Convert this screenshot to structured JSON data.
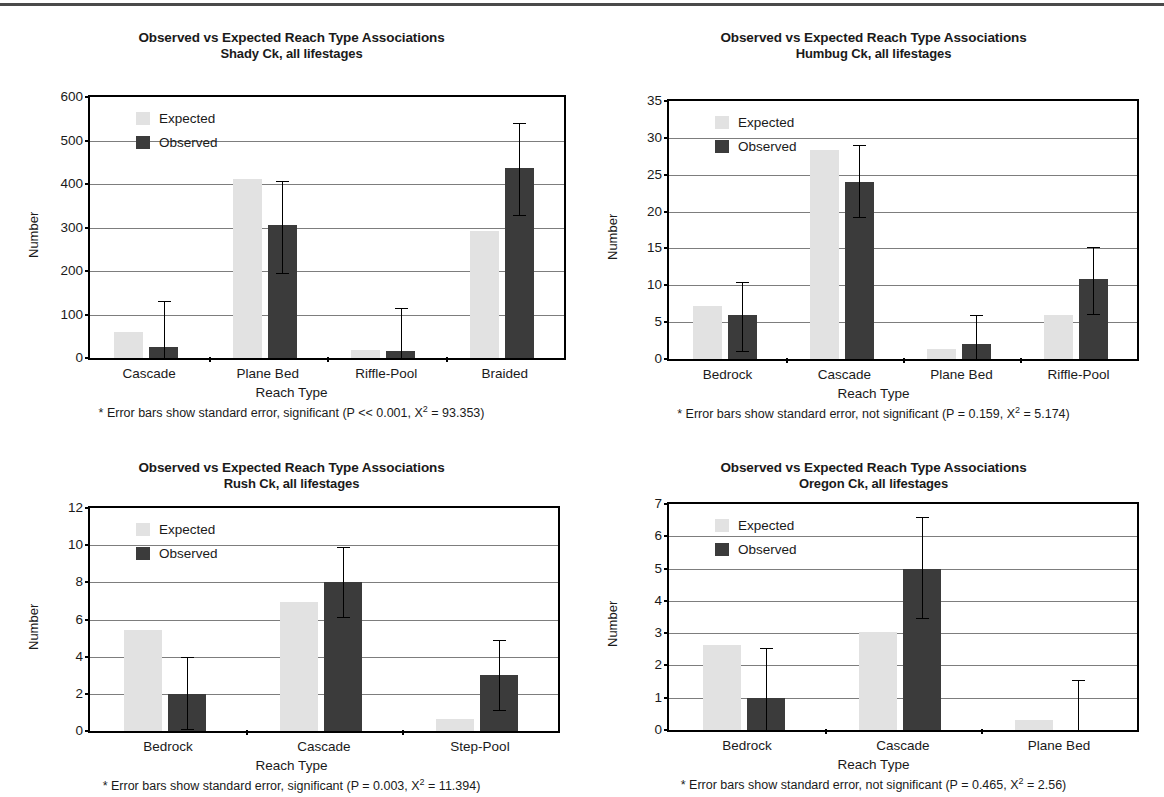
{
  "page": {
    "rule": true
  },
  "legend": {
    "expected_label": "Expected",
    "observed_label": "Observed",
    "expected_color": "#e2e2e2",
    "observed_color": "#3b3b3b"
  },
  "common": {
    "title_line1": "Observed vs Expected Reach Type Associations",
    "ylabel": "Number",
    "xlabel": "Reach Type"
  },
  "chart_data": [
    {
      "id": "shady-ck",
      "type": "bar",
      "title": "Observed vs Expected Reach Type Associations",
      "subtitle": "Shady Ck, all lifestages",
      "xlabel": "Reach Type",
      "ylabel": "Number",
      "ylim": [
        0,
        600
      ],
      "yticks": [
        0,
        100,
        200,
        300,
        400,
        500,
        600
      ],
      "grid": true,
      "legend_position": "top-left-inside",
      "categories": [
        "Cascade",
        "Plane Bed",
        "Riffle-Pool",
        "Braided"
      ],
      "series": [
        {
          "name": "Expected",
          "values": [
            60,
            411,
            18,
            293
          ]
        },
        {
          "name": "Observed",
          "values": [
            25,
            305,
            17,
            436
          ],
          "err_low": [
            25,
            110,
            17,
            108
          ],
          "err_high": [
            107,
            103,
            97,
            105
          ]
        }
      ],
      "footnote": "* Error bars show standard error, significant (P << 0.001, X2 = 93.353)",
      "footnote_parts": {
        "prefix": "* Error bars show standard error, significant (P << 0.001, X",
        "sup": "2",
        "suffix": " = 93.353)"
      }
    },
    {
      "id": "humbug-ck",
      "type": "bar",
      "title": "Observed vs Expected Reach Type Associations",
      "subtitle": "Humbug Ck, all lifestages",
      "xlabel": "Reach Type",
      "ylabel": "Number",
      "ylim": [
        0,
        35
      ],
      "yticks": [
        0,
        5,
        10,
        15,
        20,
        25,
        30,
        35
      ],
      "grid": true,
      "legend_position": "top-left-inside",
      "categories": [
        "Bedrock",
        "Cascade",
        "Plane Bed",
        "Riffle-Pool"
      ],
      "series": [
        {
          "name": "Expected",
          "values": [
            7.2,
            28.4,
            1.3,
            6.0
          ]
        },
        {
          "name": "Observed",
          "values": [
            6.0,
            24.0,
            2.0,
            10.9
          ],
          "err_low": [
            4.9,
            4.8,
            2.0,
            4.8
          ],
          "err_high": [
            4.4,
            5.0,
            4.0,
            4.3
          ]
        }
      ],
      "footnote": "* Error bars show standard error, not significant (P = 0.159, X2 = 5.174)",
      "footnote_parts": {
        "prefix": "* Error bars show standard error, not significant (P = 0.159, X",
        "sup": "2",
        "suffix": " = 5.174)"
      }
    },
    {
      "id": "rush-ck",
      "type": "bar",
      "title": "Observed vs Expected Reach Type Associations",
      "subtitle": "Rush Ck, all lifestages",
      "xlabel": "Reach Type",
      "ylabel": "Number",
      "ylim": [
        0,
        12
      ],
      "yticks": [
        0,
        2,
        4,
        6,
        8,
        10,
        12
      ],
      "grid": true,
      "legend_position": "top-left-inside",
      "categories": [
        "Bedrock",
        "Cascade",
        "Step-Pool"
      ],
      "series": [
        {
          "name": "Expected",
          "values": [
            5.45,
            6.95,
            0.65
          ]
        },
        {
          "name": "Observed",
          "values": [
            2.0,
            8.0,
            3.0
          ],
          "err_low": [
            1.9,
            1.85,
            1.85
          ],
          "err_high": [
            2.0,
            1.9,
            1.9
          ]
        }
      ],
      "footnote": "* Error bars show standard error, significant (P = 0.003, X2 = 11.394)",
      "footnote_parts": {
        "prefix": "* Error bars show standard error, significant (P = 0.003, X",
        "sup": "2",
        "suffix": " = 11.394)"
      }
    },
    {
      "id": "oregon-ck",
      "type": "bar",
      "title": "Observed vs Expected Reach Type Associations",
      "subtitle": "Oregon Ck, all lifestages",
      "xlabel": "Reach Type",
      "ylabel": "Number",
      "ylim": [
        0,
        7
      ],
      "yticks": [
        0,
        1,
        2,
        3,
        4,
        5,
        6,
        7
      ],
      "grid": true,
      "legend_position": "top-left-inside",
      "categories": [
        "Bedrock",
        "Cascade",
        "Plane Bed"
      ],
      "series": [
        {
          "name": "Expected",
          "values": [
            2.62,
            3.05,
            0.32
          ]
        },
        {
          "name": "Observed",
          "values": [
            1.0,
            5.0,
            0.0
          ],
          "err_low": [
            1.0,
            1.52,
            0.0
          ],
          "err_high": [
            1.55,
            1.6,
            1.55
          ]
        }
      ],
      "footnote": "* Error bars show standard error, not significant (P = 0.465, X2 = 2.56)",
      "footnote_parts": {
        "prefix": "* Error bars show standard error, not significant (P = 0.465, X",
        "sup": "2",
        "suffix": " = 2.56)"
      }
    }
  ]
}
